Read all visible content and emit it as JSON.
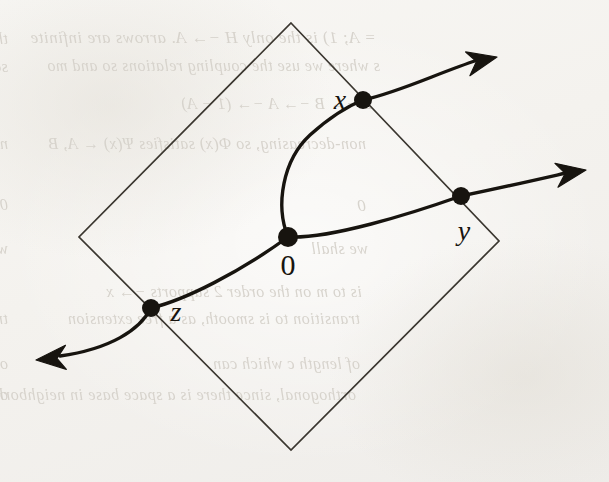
{
  "figure": {
    "kind": "geometric-diagram",
    "background_color": "#f4f2ee",
    "ink_color": "#17140f",
    "square_line_color": "#3a362f"
  },
  "chart_data": {
    "type": "scatter",
    "title": "",
    "xlabel": "",
    "ylabel": "",
    "shapes": [
      {
        "name": "rotated-square",
        "vertices": [
          [
            291,
            23
          ],
          [
            499,
            241
          ],
          [
            291,
            450
          ],
          [
            79,
            237
          ]
        ]
      }
    ],
    "points": [
      {
        "id": "x",
        "label": "x",
        "coords": [
          363,
          100
        ],
        "label_coords": [
          340,
          100
        ],
        "radius": 9
      },
      {
        "id": "y",
        "label": "y",
        "coords": [
          461,
          196
        ],
        "label_coords": [
          464,
          231
        ],
        "radius": 9
      },
      {
        "id": "0",
        "label": "0",
        "coords": [
          288,
          237
        ],
        "label_coords": [
          288,
          265
        ],
        "radius": 10
      },
      {
        "id": "z",
        "label": "z",
        "coords": [
          151,
          308
        ],
        "label_coords": [
          176,
          312
        ],
        "radius": 9
      }
    ],
    "curves": [
      {
        "name": "zero-to-x",
        "from": "0",
        "to": "x",
        "path": "M 288 237 C 275 205, 283 160, 310 135 C 330 117, 348 106, 363 100"
      },
      {
        "name": "zero-to-y",
        "from": "0",
        "to": "y",
        "path": "M 288 237 C 330 239, 410 214, 461 196"
      },
      {
        "name": "z-to-zero",
        "from": "z",
        "to": "0",
        "path": "M 151 308 C 185 300, 240 272, 288 237"
      },
      {
        "name": "x-arrow",
        "from": "x",
        "to": "arrow-up-right",
        "path": "M 363 100 C 400 92, 440 72, 478 60"
      },
      {
        "name": "y-arrow",
        "from": "y",
        "to": "arrow-right",
        "path": "M 461 196 C 500 188, 535 180, 566 173"
      },
      {
        "name": "z-arrow",
        "from": "z",
        "to": "arrow-down-left",
        "path": "M 151 308 C 140 330, 110 349, 60 356"
      }
    ],
    "arrowheads": [
      {
        "name": "arrowhead-x",
        "tip": [
          497,
          57
        ],
        "angle_deg": -15
      },
      {
        "name": "arrowhead-y",
        "tip": [
          586,
          170
        ],
        "angle_deg": -12
      },
      {
        "name": "arrowhead-z",
        "tip": [
          36,
          360
        ],
        "angle_deg": 173
      }
    ],
    "legend": [],
    "grid": false
  },
  "labels": {
    "x": "x",
    "y": "y",
    "zero": "0",
    "z": "z"
  },
  "bleedthrough": {
    "note": "faint mirrored text showing through from reverse side of the scanned page",
    "color": "#d5d1ca",
    "lines": [
      {
        "text": "= A;   1) is the only H   −→ A.  arrows are infinite",
        "x": 376,
        "y": 28,
        "size": 17
      },
      {
        "text": "s where we use the coupling relations   so and mo",
        "x": 380,
        "y": 57,
        "size": 16
      },
      {
        "text": "E −→ B −→ A −→ (1 − A)",
        "x": 372,
        "y": 95,
        "size": 16
      },
      {
        "text": "non-decreasing, so Φ(x) satisfies Ψ(x) ← A, B",
        "x": 366,
        "y": 135,
        "size": 16
      },
      {
        "text": "0",
        "x": 366,
        "y": 196,
        "size": 17
      },
      {
        "text": "we shall",
        "x": 368,
        "y": 240,
        "size": 16
      },
      {
        "text": "is to m   on the order   2   supports   −→ x",
        "x": 362,
        "y": 283,
        "size": 16
      },
      {
        "text": "transition to   is smooth, as a free extension",
        "x": 360,
        "y": 310,
        "size": 16
      },
      {
        "text": "of length c which can",
        "x": 360,
        "y": 355,
        "size": 16
      },
      {
        "text": "orthogonal, since there is a space base in neighborhood",
        "x": 356,
        "y": 386,
        "size": 16
      },
      {
        "text": "the coupling relations",
        "x": 8,
        "y": 30,
        "size": 16
      },
      {
        "text": "so and mo",
        "x": 8,
        "y": 58,
        "size": 16
      },
      {
        "text": "non-decreasing satisfies A, B",
        "x": 8,
        "y": 135,
        "size": 16
      },
      {
        "text": "0   of N(ω)",
        "x": 8,
        "y": 196,
        "size": 16
      },
      {
        "text": "we shall",
        "x": 8,
        "y": 240,
        "size": 16
      },
      {
        "text": "transition to",
        "x": 8,
        "y": 310,
        "size": 16
      },
      {
        "text": "of length c",
        "x": 8,
        "y": 355,
        "size": 16
      },
      {
        "text": "orthogonal, since there is",
        "x": 8,
        "y": 386,
        "size": 16
      }
    ]
  }
}
